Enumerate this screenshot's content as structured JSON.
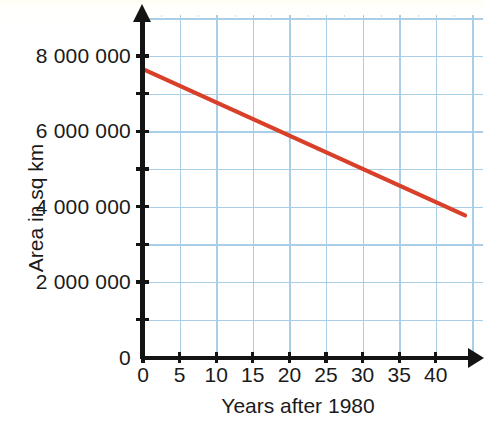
{
  "chart_data": {
    "type": "line",
    "title": "",
    "subtitle": "",
    "xlabel": "Years after 1980",
    "ylabel": "Area in sq km",
    "xlim": [
      0,
      44
    ],
    "ylim": [
      0,
      8600000
    ],
    "grid": true,
    "legend": false,
    "legend_position": "none",
    "x_ticks": [
      0,
      5,
      10,
      15,
      20,
      25,
      30,
      35,
      40
    ],
    "x_tick_labels": [
      "0",
      "5",
      "10",
      "15",
      "20",
      "25",
      "30",
      "35",
      "40"
    ],
    "y_ticks": [
      0,
      1000000,
      2000000,
      3000000,
      4000000,
      5000000,
      6000000,
      7000000,
      8000000
    ],
    "y_tick_labels": [
      "0",
      "",
      "2 000 000",
      "",
      "4 000 000",
      "",
      "6 000 000",
      "",
      "8 000 000"
    ],
    "y_origin_label": "0",
    "series": [
      {
        "name": "Area",
        "color": "#d8402a",
        "x": [
          0,
          44
        ],
        "values": [
          7650000,
          3770000
        ],
        "points": [
          {
            "x": 0,
            "y": 7650000
          },
          {
            "x": 5,
            "y": 7210000
          },
          {
            "x": 10,
            "y": 6770000
          },
          {
            "x": 15,
            "y": 6320000
          },
          {
            "x": 20,
            "y": 5880000
          },
          {
            "x": 25,
            "y": 5440000
          },
          {
            "x": 30,
            "y": 5000000
          },
          {
            "x": 35,
            "y": 4540000
          },
          {
            "x": 40,
            "y": 4100000
          },
          {
            "x": 44,
            "y": 3770000
          }
        ]
      }
    ]
  },
  "axes": {
    "y_title": "Area in sq km",
    "x_title": "Years after 1980",
    "y_labels": [
      {
        "value": 8000000,
        "text": "8 000 000"
      },
      {
        "value": 6000000,
        "text": "6 000 000"
      },
      {
        "value": 4000000,
        "text": "4 000 000"
      },
      {
        "value": 2000000,
        "text": "2 000 000"
      },
      {
        "value": 0,
        "text": "0"
      }
    ],
    "x_labels": [
      {
        "value": 0,
        "text": "0"
      },
      {
        "value": 5,
        "text": "5"
      },
      {
        "value": 10,
        "text": "10"
      },
      {
        "value": 15,
        "text": "15"
      },
      {
        "value": 20,
        "text": "20"
      },
      {
        "value": 25,
        "text": "25"
      },
      {
        "value": 30,
        "text": "30"
      },
      {
        "value": 35,
        "text": "35"
      },
      {
        "value": 40,
        "text": "40"
      }
    ]
  },
  "colors": {
    "line": "#d8402a",
    "grid_major": "#a9cfe8",
    "grid_minor": "#c6e0f2",
    "axis": "#141414",
    "text": "#1a1a1a",
    "background": "#ffffff"
  }
}
